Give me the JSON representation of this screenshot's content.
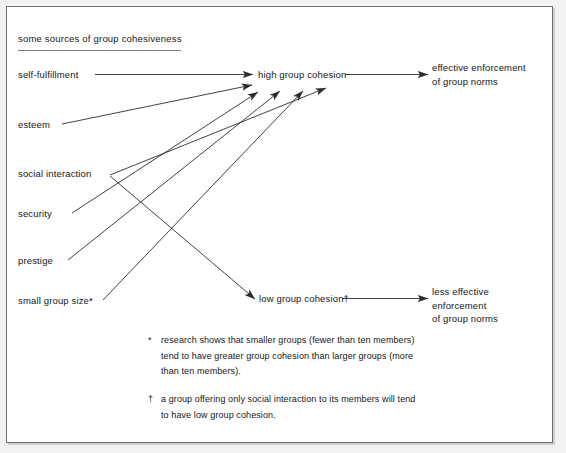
{
  "figure": {
    "title": "some sources of group cohesiveness",
    "background_color": "#ffffff",
    "line_color": "#2b2b2b",
    "text_color": "#161616",
    "frame_color": "#6e6e6e"
  },
  "sources": [
    {
      "label": "self-fulfillment"
    },
    {
      "label": "esteem"
    },
    {
      "label": "social interaction"
    },
    {
      "label": "security"
    },
    {
      "label": "prestige"
    },
    {
      "label": "small group size*"
    }
  ],
  "outcomes": {
    "high_cohesion": "high group cohesion",
    "low_cohesion": "low group cohesion†",
    "effective": "effective enforcement\nof group norms",
    "less_effective": "less effective\nenforcement\nof group norms"
  },
  "footnotes": [
    {
      "marker": "*",
      "text": "research shows that smaller groups (fewer than ten members)\ntend to have greater group cohesion than larger groups (more\nthan ten members)."
    },
    {
      "marker": "†",
      "text": "a group offering only social interaction to its members will tend\nto have low group cohesion."
    }
  ],
  "flows": [
    {
      "from": "self-fulfillment",
      "to": "high group cohesion"
    },
    {
      "from": "esteem",
      "to": "high group cohesion"
    },
    {
      "from": "social interaction",
      "to": "low group cohesion"
    },
    {
      "from": "security",
      "to": "high group cohesion"
    },
    {
      "from": "prestige",
      "to": "high group cohesion"
    },
    {
      "from": "small group size",
      "to": "high group cohesion"
    },
    {
      "from": "high group cohesion",
      "to": "effective enforcement of group norms"
    },
    {
      "from": "low group cohesion",
      "to": "less effective enforcement of group norms"
    }
  ]
}
